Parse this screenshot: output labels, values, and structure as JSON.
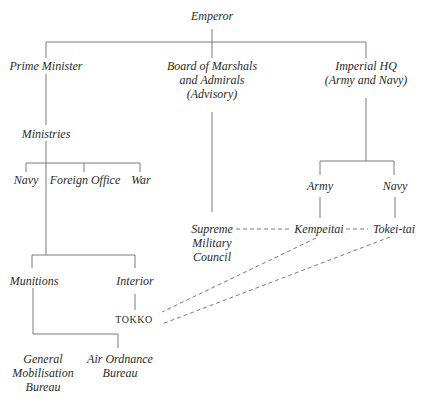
{
  "diagram": {
    "type": "organization-chart",
    "line_color": "#7a7a7a",
    "nodes": {
      "emperor": [
        "Emperor"
      ],
      "prime_minister": [
        "Prime Minister"
      ],
      "board": [
        "Board of Marshals",
        "and Admirals",
        "(Advisory)"
      ],
      "imperial_hq": [
        "Imperial HQ",
        "(Army and Navy)"
      ],
      "ministries": [
        "Ministries"
      ],
      "navy_ministry": [
        "Navy"
      ],
      "foreign_office": [
        "Foreign Office"
      ],
      "war": [
        "War"
      ],
      "army": [
        "Army"
      ],
      "navy_hq": [
        "Navy"
      ],
      "supreme_council": [
        "Supreme",
        "Military",
        "Council"
      ],
      "kempeitai": [
        "Kempeitai"
      ],
      "tokei_tai": [
        "Tokei-tai"
      ],
      "munitions": [
        "Munitions"
      ],
      "interior": [
        "Interior"
      ],
      "tokko": [
        "TOKKO"
      ],
      "general_mobilisation": [
        "General",
        "Mobilisation",
        "Bureau"
      ],
      "air_ordnance": [
        "Air Ordnance",
        "Bureau"
      ]
    }
  }
}
